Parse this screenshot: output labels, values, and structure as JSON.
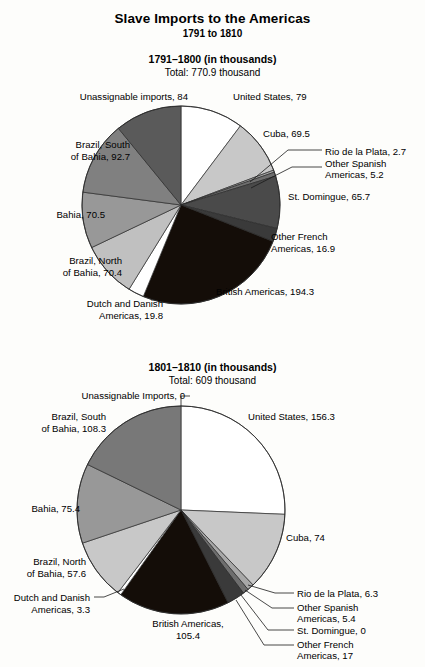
{
  "header": {
    "title": "Slave Imports to the Americas",
    "subtitle": "1791 to 1810"
  },
  "charts": [
    {
      "id": "chart-1791-1800",
      "title": "1791–1800 (in thousands)",
      "total_label": "Total: 770.9 thousand"
    },
    {
      "id": "chart-1801-1810",
      "title": "1801–1810 (in thousands)",
      "total_label": "Total: 609 thousand"
    }
  ],
  "labels_1": {
    "unassignable": "Unassignable imports, 84",
    "united_states": "United States, 79",
    "cuba": "Cuba, 69.5",
    "rio": "Rio de la Plata, 2.7",
    "other_spanish_1": "Other Spanish",
    "other_spanish_2": "Americas, 5.2",
    "st_domingue": "St. Domingue, 65.7",
    "other_french_1": "Other French",
    "other_french_2": "Americas, 16.9",
    "british": "British Americas, 194.3",
    "dutch_1": "Dutch and Danish",
    "dutch_2": "Americas, 19.8",
    "brazil_north_1": "Brazil, North",
    "brazil_north_2": "of Bahia, 70.4",
    "bahia": "Bahia, 70.5",
    "brazil_south_1": "Brazil, South",
    "brazil_south_2": "of Bahia, 92.7"
  },
  "labels_2": {
    "unassignable": "Unassignable Imports, 0",
    "united_states": "United States, 156.3",
    "cuba": "Cuba, 74",
    "rio": "Rio de la Plata, 6.3",
    "other_spanish_1": "Other Spanish",
    "other_spanish_2": "Americas, 5.4",
    "st_domingue": "St. Domingue, 0",
    "other_french_1": "Other French",
    "other_french_2": "Americas, 17",
    "british_1": "British Americas,",
    "british_2": "105.4",
    "dutch_1": "Dutch and Danish",
    "dutch_2": "Americas, 3.3",
    "brazil_north_1": "Brazil, North",
    "brazil_north_2": "of Bahia, 57.6",
    "bahia": "Bahia, 75.4",
    "brazil_south_1": "Brazil, South",
    "brazil_south_2": "of Bahia, 108.3"
  },
  "chart_data": [
    {
      "type": "pie",
      "title": "1791–1800 (in thousands)",
      "subtitle": "Total: 770.9 thousand",
      "units": "thousands",
      "total": 770.9,
      "start_angle_deg": 0,
      "direction": "clockwise",
      "categories": [
        "United States",
        "Cuba",
        "Rio de la Plata",
        "Other Spanish Americas",
        "St. Domingue",
        "Other French Americas",
        "British Americas",
        "Dutch and Danish Americas",
        "Brazil, North of Bahia",
        "Bahia",
        "Brazil, South of Bahia",
        "Unassignable imports"
      ],
      "values": [
        79,
        69.5,
        2.7,
        5.2,
        65.7,
        16.9,
        194.3,
        19.8,
        70.4,
        70.5,
        92.7,
        84
      ],
      "colors": [
        "#ffffff",
        "#c8c8c8",
        "#a8a8a8",
        "#6e6e6e",
        "#4a4a4a",
        "#3a3a3a",
        "#140d08",
        "#ffffff",
        "#c0c0c0",
        "#989898",
        "#808080",
        "#5a5a5a"
      ]
    },
    {
      "type": "pie",
      "title": "1801–1810 (in thousands)",
      "subtitle": "Total: 609 thousand",
      "units": "thousands",
      "total": 609,
      "start_angle_deg": 0,
      "direction": "clockwise",
      "categories": [
        "United States",
        "Cuba",
        "Rio de la Plata",
        "Other Spanish Americas",
        "St. Domingue",
        "Other French Americas",
        "British Americas",
        "Dutch and Danish Americas",
        "Brazil, North of Bahia",
        "Bahia",
        "Brazil, South of Bahia",
        "Unassignable Imports"
      ],
      "values": [
        156.3,
        74,
        6.3,
        5.4,
        0,
        17,
        105.4,
        3.3,
        57.6,
        75.4,
        108.3,
        0
      ],
      "colors": [
        "#ffffff",
        "#c8c8c8",
        "#a8a8a8",
        "#6e6e6e",
        "#4a4a4a",
        "#3a3a3a",
        "#140d08",
        "#ffffff",
        "#c8c8c8",
        "#989898",
        "#787878",
        "#5a5a5a"
      ]
    }
  ]
}
